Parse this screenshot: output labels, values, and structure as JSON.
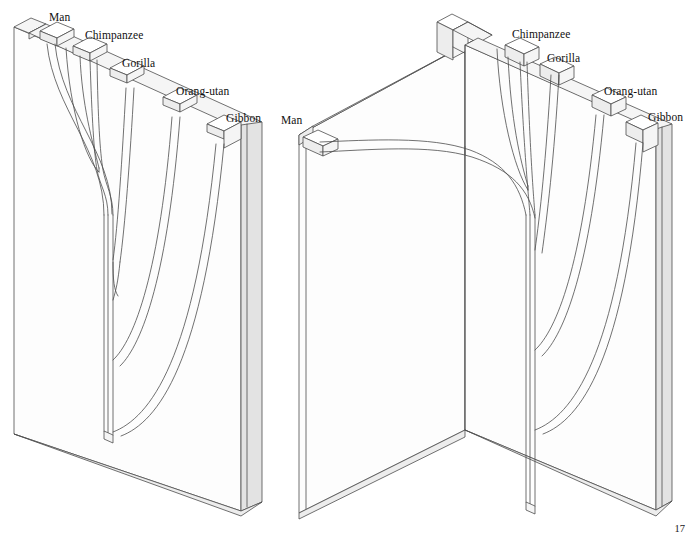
{
  "figure": {
    "page_number": "17",
    "caption": "",
    "taxa": [
      "Man",
      "Chimpanzee",
      "Gorilla",
      "Orang-utan",
      "Gibbon"
    ],
    "colors": {
      "background": "#ffffff",
      "outline": "#4a4a4a",
      "face_light": "#fcfcfc",
      "face_mid": "#f4f4f4",
      "face_shade": "#ececec",
      "face_dark": "#e2e2e2",
      "text": "#111111"
    }
  },
  "left_diagram": {
    "name": "flat-slab-tree",
    "labels": [
      {
        "text": "Man",
        "x": 49,
        "y": 12
      },
      {
        "text": "Chimpanzee",
        "x": 85,
        "y": 30
      },
      {
        "text": "Gorilla",
        "x": 122,
        "y": 58
      },
      {
        "text": "Orang-utan",
        "x": 176,
        "y": 86
      },
      {
        "text": "Gibbon",
        "x": 226,
        "y": 113
      }
    ]
  },
  "right_diagram": {
    "name": "folded-corner-tree",
    "labels": [
      {
        "text": "Man",
        "x": 281,
        "y": 115
      },
      {
        "text": "Chimpanzee",
        "x": 512,
        "y": 29
      },
      {
        "text": "Gorilla",
        "x": 547,
        "y": 53
      },
      {
        "text": "Orang-utan",
        "x": 604,
        "y": 86
      },
      {
        "text": "Gibbon",
        "x": 648,
        "y": 112
      }
    ]
  }
}
